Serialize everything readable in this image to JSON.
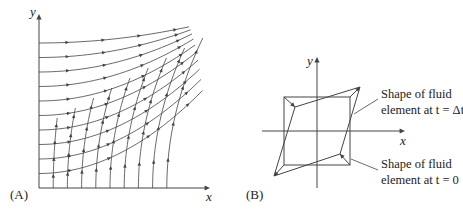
{
  "panel_a": {
    "label": "(A)",
    "x_axis_label": "x",
    "y_axis_label": "y",
    "description": "Streamlines of a rotating/straining flow near a corner"
  },
  "panel_b": {
    "label": "(B)",
    "x_axis_label": "x",
    "y_axis_label": "y",
    "annotation_dt_line1": "Shape of fluid",
    "annotation_dt_line2": "element at t = Δt",
    "annotation_0_line1": "Shape of fluid",
    "annotation_0_line2": "element at t = 0"
  },
  "colors": {
    "line": "#444444",
    "text": "#222222"
  }
}
